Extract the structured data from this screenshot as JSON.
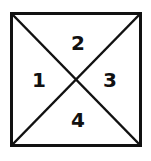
{
  "diagram": {
    "shape": "square divided by two diagonals into four triangular regions",
    "regions": [
      {
        "id": "left",
        "label": "1"
      },
      {
        "id": "top",
        "label": "2"
      },
      {
        "id": "right",
        "label": "3"
      },
      {
        "id": "bottom",
        "label": "4"
      }
    ],
    "colors": {
      "stroke": "#111111",
      "background": "#ffffff"
    }
  }
}
